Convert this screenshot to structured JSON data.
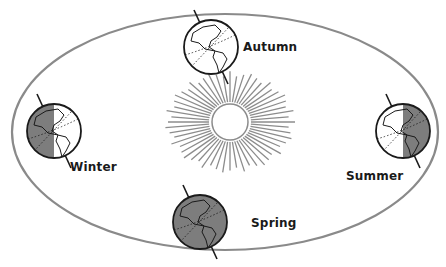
{
  "diagram": {
    "colors": {
      "orbit": "#8a8a8a",
      "sun_rays": "#8c8c8c",
      "globe_outline": "#1a1a1a",
      "globe_night": "#7d7d7d",
      "globe_day": "#ffffff",
      "label_text": "#1a1a1a"
    },
    "sun": {
      "label": "Sun",
      "cx": 230,
      "cy": 122,
      "r": 18,
      "rays": 56
    },
    "orbit": {
      "cx": 225,
      "cy": 132,
      "rx": 213,
      "ry": 118
    },
    "seasons": [
      {
        "name": "Autumn",
        "label": "Autumn",
        "cx": 211,
        "cy": 47,
        "r": 27,
        "shade": "none",
        "label_x": 243,
        "label_y": 48
      },
      {
        "name": "Winter",
        "label": "Winter",
        "cx": 54,
        "cy": 131,
        "r": 27,
        "shade": "left",
        "label_x": 70,
        "label_y": 168
      },
      {
        "name": "Summer",
        "label": "Summer",
        "cx": 403,
        "cy": 131,
        "r": 27,
        "shade": "right",
        "label_x": 346,
        "label_y": 177
      },
      {
        "name": "Spring",
        "label": "Spring",
        "cx": 200,
        "cy": 222,
        "r": 27,
        "shade": "all",
        "label_x": 251,
        "label_y": 224
      }
    ]
  }
}
